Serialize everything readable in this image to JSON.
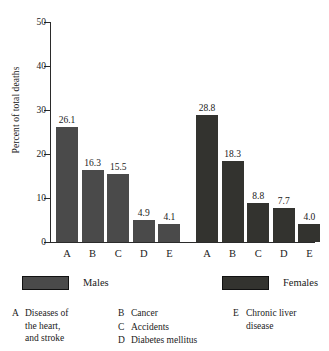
{
  "chart_data": {
    "type": "bar",
    "title": "",
    "subtitle": "",
    "xlabel": "",
    "ylabel": "Percent of total deaths",
    "ylim": [
      0,
      50
    ],
    "yticks": [
      0,
      10,
      20,
      30,
      40,
      50
    ],
    "ytick_labels": [
      "0",
      "10",
      "20",
      "30",
      "40",
      "50"
    ],
    "grid": false,
    "legend_position": "below-axis",
    "categories": [
      "A",
      "B",
      "C",
      "D",
      "E"
    ],
    "series": [
      {
        "name": "Males",
        "color": "#4a4a4a",
        "values": [
          26.1,
          16.3,
          15.5,
          4.9,
          4.1
        ],
        "value_labels": [
          "26.1",
          "16.3",
          "15.5",
          "4.9",
          "4.1"
        ]
      },
      {
        "name": "Females",
        "color": "#33332f",
        "values": [
          28.8,
          18.3,
          8.8,
          7.7,
          4.0
        ],
        "value_labels": [
          "28.8",
          "18.3",
          "8.8",
          "7.7",
          "4.0"
        ]
      }
    ],
    "category_key": [
      {
        "letter": "A",
        "text": "Diseases of\nthe heart,\nand stroke"
      },
      {
        "letter": "B",
        "text": "Cancer"
      },
      {
        "letter": "C",
        "text": "Accidents"
      },
      {
        "letter": "D",
        "text": "Diabetes mellitus"
      },
      {
        "letter": "E",
        "text": "Chronic liver\ndisease"
      }
    ]
  },
  "axis": {
    "y_title": "Percent of total deaths",
    "ticks": [
      {
        "label": "50",
        "value": 50
      },
      {
        "label": "40",
        "value": 40
      },
      {
        "label": "30",
        "value": 30
      },
      {
        "label": "20",
        "value": 20
      },
      {
        "label": "10",
        "value": 10
      },
      {
        "label": "0",
        "value": 0
      }
    ]
  },
  "bars": [
    {
      "group": "Males",
      "category": "A",
      "value": 26.1,
      "label": "26.1"
    },
    {
      "group": "Males",
      "category": "B",
      "value": 16.3,
      "label": "16.3"
    },
    {
      "group": "Males",
      "category": "C",
      "value": 15.5,
      "label": "15.5"
    },
    {
      "group": "Males",
      "category": "D",
      "value": 4.9,
      "label": "4.9"
    },
    {
      "group": "Males",
      "category": "E",
      "value": 4.1,
      "label": "4.1"
    },
    {
      "group": "Females",
      "category": "A",
      "value": 28.8,
      "label": "28.8"
    },
    {
      "group": "Females",
      "category": "B",
      "value": 18.3,
      "label": "18.3"
    },
    {
      "group": "Females",
      "category": "C",
      "value": 8.8,
      "label": "8.8"
    },
    {
      "group": "Females",
      "category": "D",
      "value": 7.7,
      "label": "7.7"
    },
    {
      "group": "Females",
      "category": "E",
      "value": 4.0,
      "label": "4.0"
    }
  ],
  "legend": {
    "males_label": "Males",
    "females_label": "Females",
    "males_color": "#4a4a4a",
    "females_color": "#33332f"
  },
  "key": {
    "col1": [
      {
        "letter": "A",
        "text": "Diseases of\nthe heart,\nand stroke"
      }
    ],
    "col2": [
      {
        "letter": "B",
        "text": "Cancer"
      },
      {
        "letter": "C",
        "text": "Accidents"
      },
      {
        "letter": "D",
        "text": "Diabetes mellitus"
      }
    ],
    "col3": [
      {
        "letter": "E",
        "text": "Chronic liver\ndisease"
      }
    ]
  }
}
